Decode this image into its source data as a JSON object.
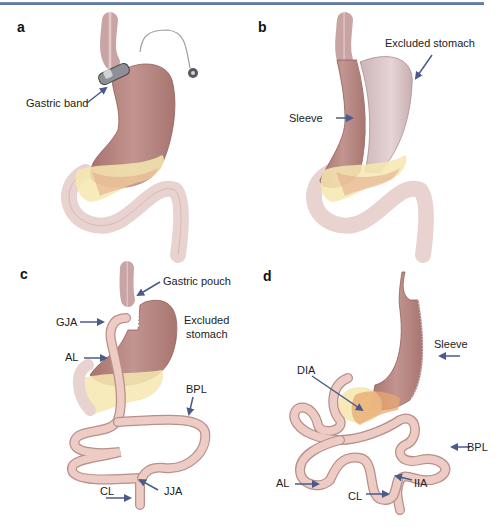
{
  "figure": {
    "panels": [
      {
        "id": "a",
        "letter": "a",
        "procedure": "adjustable gastric banding",
        "labels": [
          {
            "text": "Gastric band"
          }
        ]
      },
      {
        "id": "b",
        "letter": "b",
        "procedure": "sleeve gastrectomy",
        "labels": [
          {
            "text": "Excluded stomach"
          },
          {
            "text": "Sleeve"
          }
        ]
      },
      {
        "id": "c",
        "letter": "c",
        "procedure": "Roux-en-Y gastric bypass",
        "labels": [
          {
            "text": "Gastric pouch"
          },
          {
            "text": "GJA"
          },
          {
            "text": "Excluded"
          },
          {
            "text": "stomach"
          },
          {
            "text": "AL"
          },
          {
            "text": "BPL"
          },
          {
            "text": "CL"
          },
          {
            "text": "JJA"
          }
        ]
      },
      {
        "id": "d",
        "letter": "d",
        "procedure": "biliopancreatic diversion with duodenal switch",
        "labels": [
          {
            "text": "Sleeve"
          },
          {
            "text": "DIA"
          },
          {
            "text": "BPL"
          },
          {
            "text": "AL"
          },
          {
            "text": "CL"
          },
          {
            "text": "IIA"
          }
        ]
      }
    ],
    "colors": {
      "arrow": "#4a5a8c",
      "stomach": "#b88580",
      "stomach_dark": "#8f5a52",
      "excluded_stomach": "#d9c3c6",
      "intestine": "#e8c6be",
      "intestine_edge": "#b98f88",
      "pancreas": "#f6e7b0",
      "duodenum_overlay": "#e8a872",
      "topline": "#6a7ea6"
    }
  }
}
